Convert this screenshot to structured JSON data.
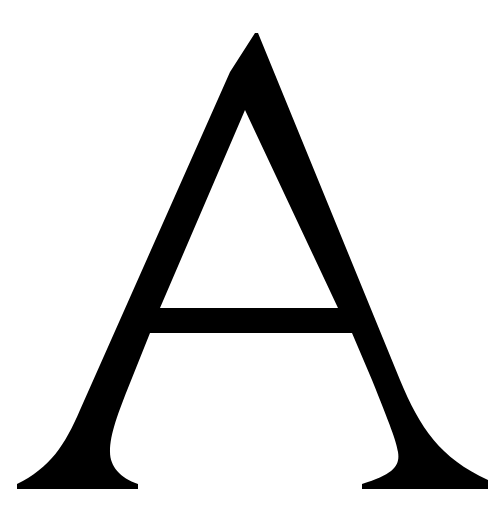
{
  "letter": "A",
  "colors": {
    "glyph": "#000000",
    "background": "#ffffff"
  }
}
